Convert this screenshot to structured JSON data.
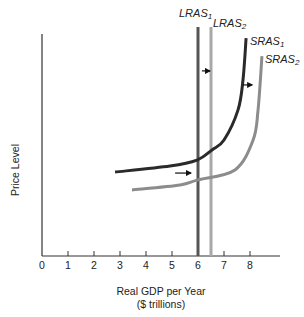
{
  "chart_data": {
    "type": "line",
    "title": "",
    "xlabel": "Real GDP per Year",
    "xlabel_line2": "($ trillions)",
    "ylabel": "Price Level",
    "xlim": [
      0,
      9.2
    ],
    "ylim": [
      0,
      8.6
    ],
    "x_ticks": [
      0,
      1,
      2,
      3,
      4,
      5,
      6,
      7,
      8
    ],
    "x_tick_labels": [
      "0",
      "1",
      "2",
      "3",
      "4",
      "5",
      "6",
      "7",
      "8"
    ],
    "y_ticks": [],
    "grid": false,
    "legend": "none (curves labeled directly)",
    "series": [
      {
        "name": "LRAS1",
        "label_main": "LRAS",
        "label_sub": "1",
        "kind": "vertical",
        "x": 6.0,
        "y_range": [
          0,
          8.8
        ],
        "color": "#555555",
        "width": 3
      },
      {
        "name": "LRAS2",
        "label_main": "LRAS",
        "label_sub": "2",
        "kind": "vertical",
        "x": 6.5,
        "y_range": [
          0,
          8.8
        ],
        "color": "#a8a8a8",
        "width": 3
      },
      {
        "name": "SRAS1",
        "label_main": "SRAS",
        "label_sub": "1",
        "kind": "curve",
        "color": "#2a2a2a",
        "width": 3,
        "points": [
          [
            2.81,
            3.23
          ],
          [
            4.92,
            3.46
          ],
          [
            5.96,
            3.69
          ],
          [
            6.54,
            4.08
          ],
          [
            7.0,
            4.46
          ],
          [
            7.54,
            5.62
          ],
          [
            7.73,
            6.77
          ],
          [
            7.85,
            8.38
          ]
        ]
      },
      {
        "name": "SRAS2",
        "label_main": "SRAS",
        "label_sub": "2",
        "kind": "curve",
        "color": "#8c8c8c",
        "width": 3,
        "points": [
          [
            3.46,
            2.54
          ],
          [
            5.31,
            2.73
          ],
          [
            5.96,
            2.92
          ],
          [
            7.42,
            3.31
          ],
          [
            8.12,
            4.46
          ],
          [
            8.31,
            5.62
          ],
          [
            8.46,
            7.69
          ]
        ]
      }
    ],
    "annotations": [
      {
        "type": "arrow",
        "direction": "right",
        "from": [
          6.15,
          7.12
        ],
        "to": [
          6.5,
          7.12
        ],
        "meaning": "LRAS shift right"
      },
      {
        "type": "arrow",
        "direction": "right",
        "from": [
          7.73,
          6.58
        ],
        "to": [
          8.12,
          6.58
        ],
        "meaning": "SRAS shift right (upper)"
      },
      {
        "type": "arrow",
        "direction": "right",
        "from": [
          5.12,
          3.19
        ],
        "to": [
          5.77,
          3.19
        ],
        "meaning": "SRAS shift right (lower)"
      }
    ]
  },
  "labels": {
    "lras1": {
      "main": "LRAS",
      "sub": "1"
    },
    "lras2": {
      "main": "LRAS",
      "sub": "2"
    },
    "sras1": {
      "main": "SRAS",
      "sub": "1"
    },
    "sras2": {
      "main": "SRAS",
      "sub": "2"
    },
    "xlabel_line1": "Real GDP per Year",
    "xlabel_line2": "($ trillions)",
    "ylabel": "Price Level",
    "ticks": [
      "0",
      "1",
      "2",
      "3",
      "4",
      "5",
      "6",
      "7",
      "8"
    ]
  }
}
